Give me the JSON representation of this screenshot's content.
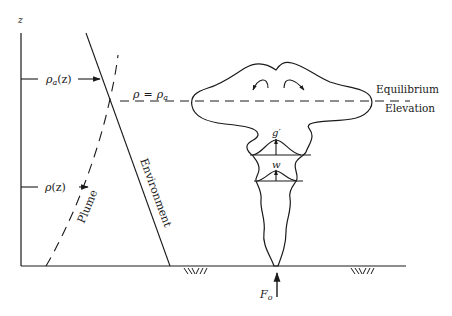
{
  "figure": {
    "axis_label_z": "z",
    "labels": {
      "rho_a_z": "ρa(z)",
      "rho_a_z_base": "ρ",
      "rho_a_z_sub": "a",
      "rho_a_z_arg": "(z)",
      "rho_z": "ρ(z)",
      "rho_z_base": "ρ",
      "rho_z_arg": "(z)",
      "equality_lhs": "ρ",
      "equality_eq": "=",
      "equality_rhs": "ρ",
      "equality_rhs_sub": "a",
      "plume": "Plume",
      "environment": "Environment",
      "equilibrium": "Equilibrium",
      "elevation": "Elevation",
      "g_prime": "g′",
      "w": "w",
      "flux": "F",
      "flux_sub": "o"
    },
    "colors": {
      "ink": "#1a1a1a",
      "background": "#ffffff"
    }
  }
}
